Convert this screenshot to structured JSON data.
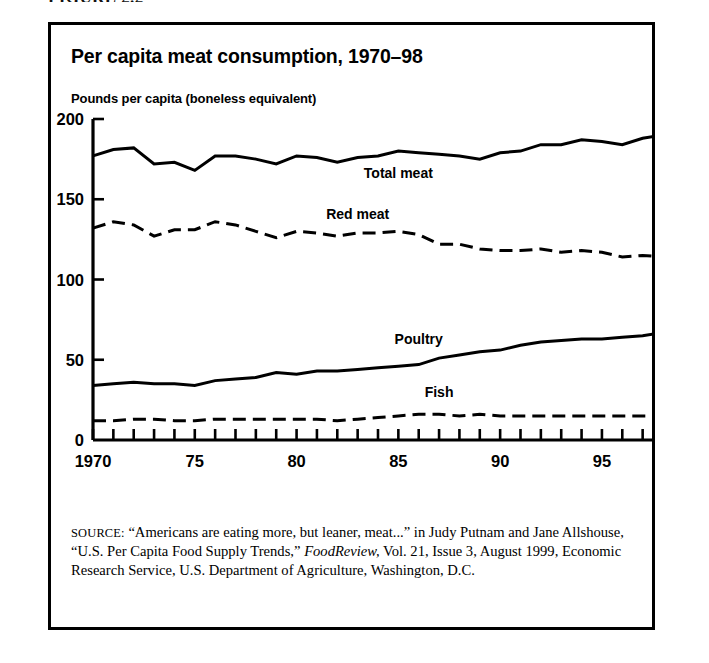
{
  "figure": {
    "caption": "FIGURE 2.2"
  },
  "chart": {
    "title": "Per capita meat consumption, 1970–98",
    "axis_note": "Pounds per capita (boneless equivalent)"
  },
  "source": {
    "label": "SOURCE:",
    "line1": " “Americans are eating more, but leaner, meat...” in Judy",
    "line2": "Putnam and Jane Allshouse, “U.S. Per Capita Food Supply Trends,”",
    "line3_italic": "FoodReview,",
    "line3_rest": " Vol.  21, Issue 3, August 1999, Economic Research",
    "line4": "Service, U.S. Department of Agriculture, Washington, D.C."
  },
  "chart_data": {
    "type": "line",
    "title": "Per capita meat consumption, 1970–98",
    "xlabel": "",
    "ylabel": "Pounds per capita (boneless equivalent)",
    "xlim": [
      1970,
      1998
    ],
    "ylim": [
      0,
      200
    ],
    "yticks": [
      0,
      50,
      100,
      150,
      200
    ],
    "ytick_labels": [
      "0",
      "50",
      "100",
      "150",
      "200"
    ],
    "xticks": [
      1970,
      1971,
      1972,
      1973,
      1974,
      1975,
      1976,
      1977,
      1978,
      1979,
      1980,
      1981,
      1982,
      1983,
      1984,
      1985,
      1986,
      1987,
      1988,
      1989,
      1990,
      1991,
      1992,
      1993,
      1994,
      1995,
      1996,
      1997,
      1998
    ],
    "xtick_labels_shown": [
      "1970",
      "75",
      "80",
      "85",
      "90",
      "95"
    ],
    "xtick_label_years": [
      1970,
      1975,
      1980,
      1985,
      1990,
      1995
    ],
    "grid": false,
    "legend": "inline-labels",
    "x": [
      1970,
      1971,
      1972,
      1973,
      1974,
      1975,
      1976,
      1977,
      1978,
      1979,
      1980,
      1981,
      1982,
      1983,
      1984,
      1985,
      1986,
      1987,
      1988,
      1989,
      1990,
      1991,
      1992,
      1993,
      1994,
      1995,
      1996,
      1997,
      1998
    ],
    "series": [
      {
        "name": "Total meat",
        "style": "solid",
        "label_x": 1985,
        "label_y": 163,
        "values": [
          177,
          181,
          182,
          172,
          173,
          168,
          177,
          177,
          175,
          172,
          177,
          176,
          173,
          176,
          177,
          180,
          179,
          178,
          177,
          175,
          179,
          180,
          184,
          184,
          187,
          186,
          184,
          188,
          190
        ]
      },
      {
        "name": "Red meat",
        "style": "dashed",
        "label_x": 1983,
        "label_y": 138,
        "values": [
          132,
          136,
          134,
          127,
          131,
          131,
          136,
          134,
          130,
          126,
          130,
          129,
          127,
          129,
          129,
          130,
          128,
          122,
          122,
          119,
          118,
          118,
          119,
          117,
          118,
          117,
          114,
          115,
          114
        ]
      },
      {
        "name": "Poultry",
        "style": "solid",
        "label_x": 1986,
        "label_y": 60,
        "values": [
          34,
          35,
          36,
          35,
          35,
          34,
          37,
          38,
          39,
          42,
          41,
          43,
          43,
          44,
          45,
          46,
          47,
          51,
          53,
          55,
          56,
          59,
          61,
          62,
          63,
          63,
          64,
          65,
          67
        ]
      },
      {
        "name": "Fish",
        "style": "dashed",
        "label_x": 1987,
        "label_y": 27,
        "values": [
          12,
          12,
          13,
          13,
          12,
          12,
          13,
          13,
          13,
          13,
          13,
          13,
          12,
          13,
          14,
          15,
          16,
          16,
          15,
          16,
          15,
          15,
          15,
          15,
          15,
          15,
          15,
          15,
          15
        ]
      }
    ]
  }
}
